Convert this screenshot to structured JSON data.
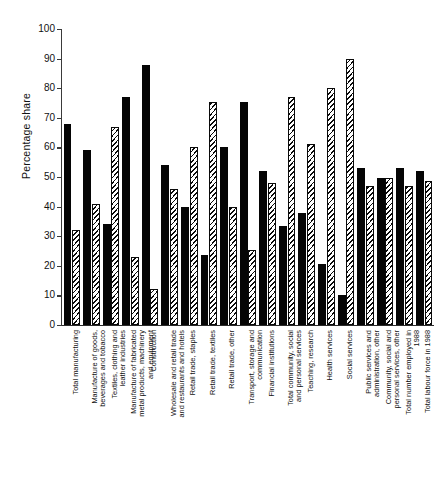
{
  "chart_data": {
    "type": "bar",
    "title": "",
    "subtitle": "",
    "xlabel": "",
    "ylabel": "Percentage share",
    "ylim": [
      0,
      100
    ],
    "yticks": [
      0,
      10,
      20,
      30,
      40,
      50,
      60,
      70,
      80,
      90,
      100
    ],
    "grid": false,
    "legend_position": "none",
    "categories": [
      "Total manufacturing",
      "Manufacture of goods, beverages and tobacco",
      "Textiles, clothing and leather industries",
      "Manufacture of fabricated metal products, machinery and equipment",
      "Construction",
      "Wholesale and retail trade and restaurants and hotels",
      "Retail trade, staples",
      "Retail trade, textiles",
      "Retail trade, other",
      "Transport, storage and communication",
      "Financial institutions",
      "Total community, social and personal services",
      "Teaching, research",
      "Health services",
      "Social services",
      "Public services and administration, other",
      "Community, social and personal services, other",
      "Total number employed in 1988",
      "Total labour force in 1988"
    ],
    "series": [
      {
        "name": "solid",
        "values": [
          68,
          59,
          34,
          77,
          88,
          54,
          40,
          23.5,
          60,
          75.5,
          52,
          33.5,
          38,
          20.5,
          10,
          53,
          49.5,
          53,
          52
        ]
      },
      {
        "name": "hatched",
        "values": [
          32,
          41,
          67,
          23,
          12,
          46,
          60,
          75.5,
          40,
          25.5,
          48,
          77,
          61,
          80,
          90,
          47,
          49.5,
          47,
          48.5
        ]
      }
    ]
  },
  "axis": {
    "y_title": "Percentage share"
  }
}
